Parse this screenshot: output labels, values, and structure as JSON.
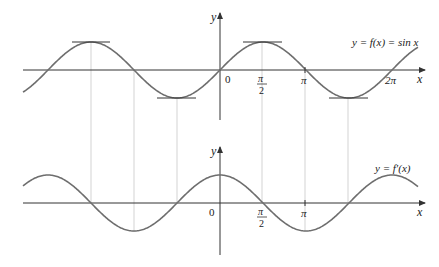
{
  "figure": {
    "top_graph": {
      "curve_label": "y = f(x) = sin x",
      "function": "sin x",
      "y_axis_label": "y",
      "x_axis_label": "x",
      "origin_label": "0",
      "tick_labels": {
        "pi_half_num": "π",
        "pi_half_den": "2",
        "pi": "π",
        "two_pi": "2π"
      },
      "tangent_lines_at": [
        "-3π/2",
        "-π/2",
        "π/2",
        "3π/2"
      ]
    },
    "bottom_graph": {
      "curve_label": "y = f′(x)",
      "function": "cos x",
      "y_axis_label": "y",
      "x_axis_label": "x",
      "origin_label": "0",
      "tick_labels": {
        "pi_half_num": "π",
        "pi_half_den": "2",
        "pi": "π"
      }
    },
    "colors": {
      "curve": "#6e6e6e",
      "axis": "#333333",
      "guide": "#c8c8c8",
      "text": "#222222"
    }
  }
}
